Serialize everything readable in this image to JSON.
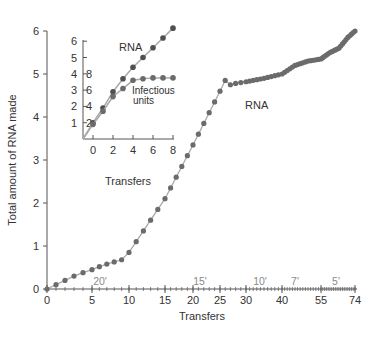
{
  "chart_data": [
    {
      "type": "line",
      "title": "",
      "xlabel": "Transfers",
      "ylabel": "Total amount of RNA made",
      "ylim": [
        0,
        6
      ],
      "y_ticks": [
        "0",
        "1",
        "2",
        "3",
        "4",
        "5",
        "6"
      ],
      "x_ticks": [
        "0",
        "5",
        "10",
        "15",
        "20",
        "25",
        "30",
        "40",
        "55",
        "74"
      ],
      "x_axis_note": "non-linear transfer axis; incubation time per transfer annotated above axis",
      "time_annotations": [
        "20'",
        "15'",
        "10'",
        "7'",
        "5'"
      ],
      "grid": false,
      "series": [
        {
          "name": "RNA",
          "label": "RNA",
          "points_px_note": "approximate readings",
          "x": [
            0,
            1,
            2,
            3,
            4,
            5,
            6,
            7,
            8,
            9,
            10,
            11,
            12,
            13,
            14,
            15,
            16,
            17,
            18,
            19,
            20,
            21,
            22,
            23,
            24,
            25,
            26,
            27,
            28,
            29,
            30,
            35,
            40,
            45,
            50,
            55,
            60,
            65,
            70,
            74
          ],
          "values": [
            0,
            0.1,
            0.2,
            0.3,
            0.38,
            0.45,
            0.52,
            0.58,
            0.63,
            0.68,
            0.85,
            1.1,
            1.35,
            1.6,
            1.85,
            2.1,
            2.35,
            2.6,
            2.85,
            3.1,
            3.35,
            3.6,
            3.85,
            4.1,
            4.35,
            4.6,
            4.85,
            4.75,
            4.78,
            4.8,
            4.82,
            4.9,
            5.0,
            5.2,
            5.3,
            5.35,
            5.5,
            5.6,
            5.85,
            6.0
          ]
        }
      ]
    },
    {
      "type": "line",
      "title": "",
      "xlabel": "Transfers",
      "ylabel": "",
      "xlim": [
        -1,
        8
      ],
      "x_ticks": [
        "0",
        "2",
        "4",
        "6",
        "8"
      ],
      "y_ticks_left": [
        "1",
        "2",
        "3",
        "4",
        "5",
        "6"
      ],
      "y_ticks_right": [
        "2",
        "4",
        "6",
        "8"
      ],
      "grid": false,
      "series": [
        {
          "name": "RNA",
          "label": "RNA",
          "x": [
            0,
            1,
            2,
            3,
            4,
            5,
            6,
            7,
            8
          ],
          "values": [
            1.0,
            1.9,
            2.9,
            3.7,
            4.4,
            5.0,
            5.6,
            6.2,
            6.8
          ]
        },
        {
          "name": "Infectious units",
          "label": "Infectious units",
          "x": [
            0,
            1,
            2,
            3,
            4,
            5,
            6,
            7,
            8
          ],
          "values": [
            0.9,
            1.7,
            2.6,
            3.1,
            3.6,
            3.7,
            3.75,
            3.75,
            3.75
          ]
        }
      ]
    }
  ],
  "labels": {
    "main_ylabel": "Total amount of RNA made",
    "main_xlabel": "Transfers",
    "main_series": "RNA",
    "inset_xlabel": "Transfers",
    "inset_rna": "RNA",
    "inset_inf_line1": "Infectious",
    "inset_inf_line2": "units"
  },
  "colors": {
    "dot": "#6b6b6b",
    "inset_dot": "#505050",
    "line": "#a9a9a9",
    "axis": "#555555",
    "text": "#333333",
    "time_text": "#8a8a8a"
  }
}
